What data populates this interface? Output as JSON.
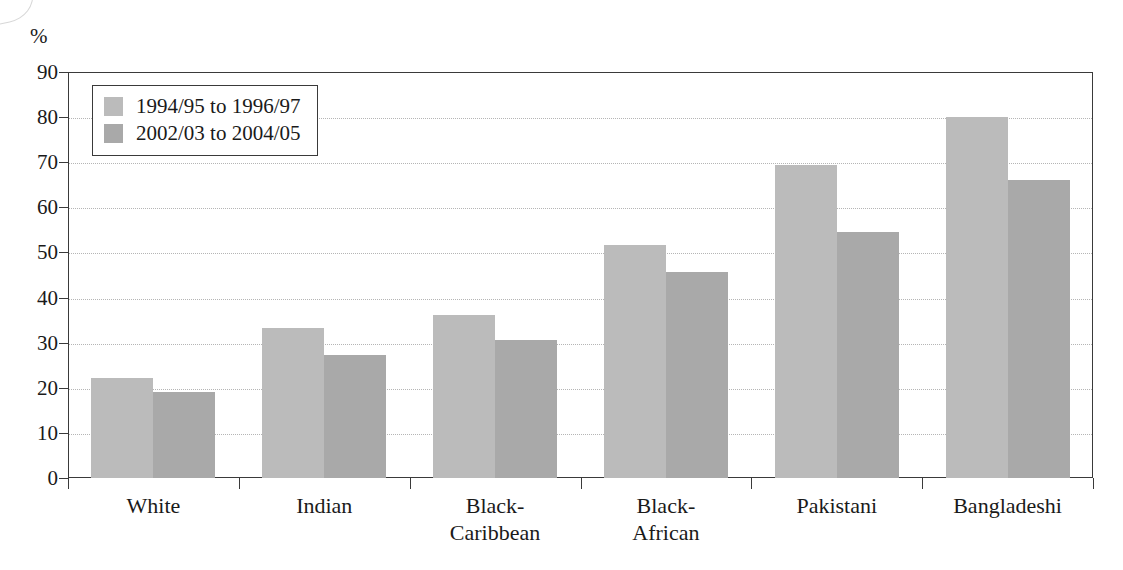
{
  "chart_data": {
    "type": "bar",
    "title": "",
    "subtitle": "",
    "xlabel": "",
    "ylabel": "%",
    "ylim": [
      0,
      90
    ],
    "ytick_step": 10,
    "yticks": [
      90,
      80,
      70,
      60,
      50,
      40,
      30,
      20,
      10,
      0
    ],
    "grid": true,
    "grid_style": "dotted-horizontal",
    "legend_position": "top-left-inside",
    "categories": [
      "White",
      "Indian",
      "Black-Caribbean",
      "Black-African",
      "Pakistani",
      "Bangladeshi"
    ],
    "category_lines": [
      [
        "White"
      ],
      [
        "Indian"
      ],
      [
        "Black-",
        "Caribbean"
      ],
      [
        "Black-",
        "African"
      ],
      [
        "Pakistani"
      ],
      [
        "Bangladeshi"
      ]
    ],
    "series": [
      {
        "name": "1994/95 to 1996/97",
        "color": "#bbbbbb",
        "values": [
          22.2,
          33.3,
          36.1,
          51.7,
          69.4,
          80.0
        ]
      },
      {
        "name": "2002/03 to 2004/05",
        "color": "#a9a9a9",
        "values": [
          19.1,
          27.3,
          30.6,
          45.7,
          54.5,
          66.1
        ]
      }
    ]
  },
  "axis": {
    "unit_label": "%"
  },
  "legend": {
    "entries": [
      {
        "label": "1994/95 to 1996/97",
        "color": "#bbbbbb"
      },
      {
        "label": "2002/03 to 2004/05",
        "color": "#a9a9a9"
      }
    ]
  },
  "colors": {
    "series1": "#bbbbbb",
    "series2": "#a9a9a9",
    "axis": "#3a3a3a",
    "grid": "#b5b5b5",
    "text": "#1a1a1a",
    "background": "#ffffff"
  }
}
